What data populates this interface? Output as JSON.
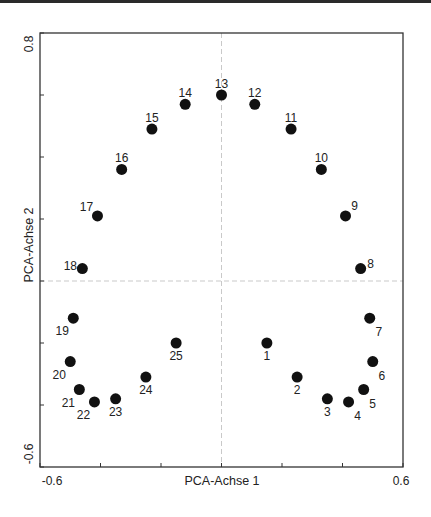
{
  "chart_data": {
    "type": "scatter",
    "title": "",
    "xlabel": "PCA-Achse 1",
    "ylabel": "PCA-Achse 2",
    "xlim": [
      -0.6,
      0.6
    ],
    "ylim": [
      -0.6,
      0.8
    ],
    "x_ticks": [
      -0.6,
      -0.4,
      -0.2,
      0,
      0.2,
      0.4,
      0.6
    ],
    "y_ticks": [
      -0.6,
      -0.4,
      -0.2,
      0,
      0.2,
      0.4,
      0.6,
      0.8
    ],
    "x_tick_labels": [
      "-0.6",
      "0.6"
    ],
    "y_tick_labels": [
      "-0.6",
      "0.8"
    ],
    "grid": false,
    "zero_lines": "dashed",
    "legend": null,
    "marker_color": "#111111",
    "points": [
      {
        "label": "1",
        "x": 0.15,
        "y": -0.2,
        "label_pos": "below"
      },
      {
        "label": "2",
        "x": 0.25,
        "y": -0.31,
        "label_pos": "below"
      },
      {
        "label": "3",
        "x": 0.35,
        "y": -0.38,
        "label_pos": "below"
      },
      {
        "label": "4",
        "x": 0.42,
        "y": -0.39,
        "label_pos": "below-right"
      },
      {
        "label": "5",
        "x": 0.47,
        "y": -0.35,
        "label_pos": "below-right"
      },
      {
        "label": "6",
        "x": 0.5,
        "y": -0.26,
        "label_pos": "below-right"
      },
      {
        "label": "7",
        "x": 0.49,
        "y": -0.12,
        "label_pos": "below-right"
      },
      {
        "label": "8",
        "x": 0.46,
        "y": 0.04,
        "label_pos": "right"
      },
      {
        "label": "9",
        "x": 0.41,
        "y": 0.21,
        "label_pos": "above-right"
      },
      {
        "label": "10",
        "x": 0.33,
        "y": 0.36,
        "label_pos": "above"
      },
      {
        "label": "11",
        "x": 0.23,
        "y": 0.49,
        "label_pos": "above"
      },
      {
        "label": "12",
        "x": 0.11,
        "y": 0.57,
        "label_pos": "above"
      },
      {
        "label": "13",
        "x": 0.0,
        "y": 0.6,
        "label_pos": "above"
      },
      {
        "label": "14",
        "x": -0.12,
        "y": 0.57,
        "label_pos": "above"
      },
      {
        "label": "15",
        "x": -0.23,
        "y": 0.49,
        "label_pos": "above"
      },
      {
        "label": "16",
        "x": -0.33,
        "y": 0.36,
        "label_pos": "above"
      },
      {
        "label": "17",
        "x": -0.41,
        "y": 0.21,
        "label_pos": "above-left"
      },
      {
        "label": "18",
        "x": -0.46,
        "y": 0.04,
        "label_pos": "left"
      },
      {
        "label": "19",
        "x": -0.49,
        "y": -0.12,
        "label_pos": "below-left"
      },
      {
        "label": "20",
        "x": -0.5,
        "y": -0.26,
        "label_pos": "below-left"
      },
      {
        "label": "21",
        "x": -0.47,
        "y": -0.35,
        "label_pos": "below-left"
      },
      {
        "label": "22",
        "x": -0.42,
        "y": -0.39,
        "label_pos": "below-left"
      },
      {
        "label": "23",
        "x": -0.35,
        "y": -0.38,
        "label_pos": "below"
      },
      {
        "label": "24",
        "x": -0.25,
        "y": -0.31,
        "label_pos": "below"
      },
      {
        "label": "25",
        "x": -0.15,
        "y": -0.2,
        "label_pos": "below"
      }
    ]
  }
}
